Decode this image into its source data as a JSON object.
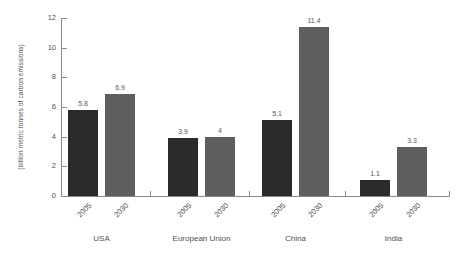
{
  "chart_data": {
    "type": "bar",
    "title": "",
    "subtitle": "",
    "xlabel": "",
    "ylabel": "(billion metric tonnes of carbon emissions)",
    "ylim": [
      0,
      12
    ],
    "yticks": [
      "0",
      "2",
      "4",
      "6",
      "8",
      "10",
      "12"
    ],
    "ytick_values": [
      0,
      2,
      4,
      6,
      8,
      10,
      12
    ],
    "grid": false,
    "legend_position": "none",
    "categories": [
      "USA",
      "European Union",
      "China",
      "India"
    ],
    "series": [
      {
        "name": "2005",
        "color": "#2b2b2b",
        "values": [
          5.8,
          3.9,
          5.1,
          1.1
        ],
        "labels": [
          "5.8",
          "3.9",
          "5.1",
          "1.1"
        ]
      },
      {
        "name": "2030",
        "color": "#5e5e5e",
        "values": [
          6.9,
          4,
          11.4,
          3.3
        ],
        "labels": [
          "6.9",
          "4",
          "11.4",
          "3.3"
        ]
      }
    ],
    "bars": [
      {
        "group": "USA",
        "year": "2005",
        "value": 5.8,
        "label": "5.8",
        "series": 0
      },
      {
        "group": "USA",
        "year": "2030",
        "value": 6.9,
        "label": "6.9",
        "series": 1
      },
      {
        "group": "European Union",
        "year": "2005",
        "value": 3.9,
        "label": "3.9",
        "series": 0
      },
      {
        "group": "European Union",
        "year": "2030",
        "value": 4,
        "label": "4",
        "series": 1
      },
      {
        "group": "China",
        "year": "2005",
        "value": 5.1,
        "label": "5.1",
        "series": 0
      },
      {
        "group": "China",
        "year": "2030",
        "value": 11.4,
        "label": "11.4",
        "series": 1
      },
      {
        "group": "India",
        "year": "2005",
        "value": 1.1,
        "label": "1.1",
        "series": 0
      },
      {
        "group": "India",
        "year": "2030",
        "value": 3.3,
        "label": "3.3",
        "series": 1
      }
    ]
  },
  "axis": {
    "y_title": "(billion metric tonnes of carbon emissions)",
    "ticks": {
      "t0": "0",
      "t2": "2",
      "t4": "4",
      "t6": "6",
      "t8": "8",
      "t10": "10",
      "t12": "12"
    }
  },
  "groups": [
    {
      "label": "USA",
      "years": [
        "2005",
        "2030"
      ]
    },
    {
      "label": "European Union",
      "years": [
        "2005",
        "2030"
      ]
    },
    {
      "label": "China",
      "years": [
        "2005",
        "2030"
      ]
    },
    {
      "label": "India",
      "years": [
        "2005",
        "2030"
      ]
    }
  ],
  "colors": {
    "background": "#ffffff",
    "axis": "#8a8a8a",
    "text": "#4f4f4f",
    "bar_2005": "#2b2b2b",
    "bar_2030": "#5e5e5e"
  }
}
